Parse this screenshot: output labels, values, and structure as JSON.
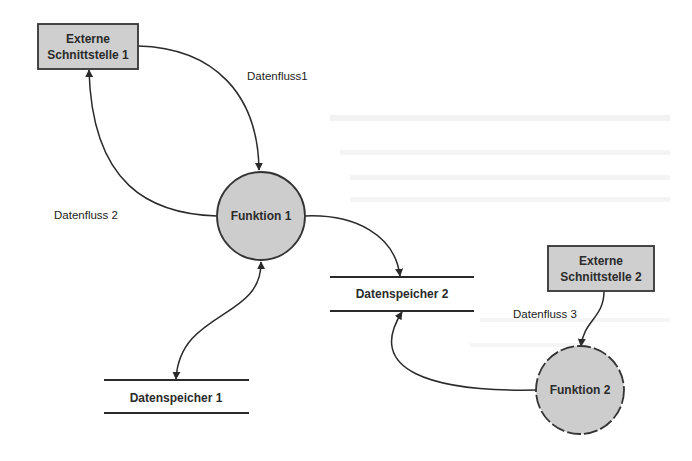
{
  "diagram": {
    "type": "data-flow-diagram",
    "colors": {
      "background": "#ffffff",
      "node_fill": "#cfcfcf",
      "stroke": "#2a2a2a",
      "text": "#2b2b2b"
    },
    "external_entities": [
      {
        "id": "ext1",
        "line1": "Externe",
        "line2": "Schnittstelle 1"
      },
      {
        "id": "ext2",
        "line1": "Externe",
        "line2": "Schnittstelle 2"
      }
    ],
    "functions": [
      {
        "id": "f1",
        "label": "Funktion 1"
      },
      {
        "id": "f2",
        "label": "Funktion 2"
      }
    ],
    "data_stores": [
      {
        "id": "ds1",
        "label": "Datenspeicher 1"
      },
      {
        "id": "ds2",
        "label": "Datenspeicher 2"
      }
    ],
    "flows": [
      {
        "id": "flow1",
        "label": "Datenfluss1",
        "from": "ext1",
        "to": "f1"
      },
      {
        "id": "flow2",
        "label": "Datenfluss 2",
        "from": "f1",
        "to": "ext1"
      },
      {
        "id": "flow3",
        "label": "Datenfluss 3",
        "from": "ext2",
        "to": "f2"
      },
      {
        "id": "flow4",
        "label": "",
        "from": "f1",
        "to": "ds2"
      },
      {
        "id": "flow5",
        "label": "",
        "from": "f1",
        "to": "ds1",
        "bidirectional": true
      },
      {
        "id": "flow6",
        "label": "",
        "from": "f2",
        "to": "ds2"
      }
    ]
  }
}
